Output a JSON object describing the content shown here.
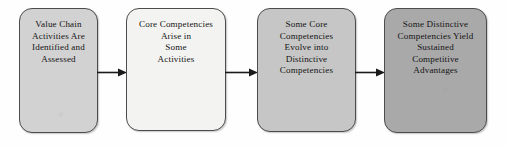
{
  "diagram": {
    "type": "flowchart",
    "orientation": "left-to-right",
    "background_color": "#fefefe",
    "text_color": "#141414",
    "nodes": [
      {
        "id": "value-chain-activities",
        "text": "Value Chain\nActivities Are\nIdentified and\nAssessed",
        "lines": [
          "Value Chain",
          "Activities Are",
          "Identified and",
          "Assessed"
        ],
        "fill_color": "#d2d2d2",
        "border_color": "#4c4c4c"
      },
      {
        "id": "core-competencies-arise",
        "text": "Core Competencies\nArise in\nSome\nActivities",
        "lines": [
          "Core Competencies",
          "Arise in",
          "Some",
          "Activities"
        ],
        "fill_color": "#f3f3f1",
        "border_color": "#4c4c4c"
      },
      {
        "id": "core-competencies-evolve",
        "text": "Some Core\nCompetencies\nEvolve into\nDistinctive\nCompetencies",
        "lines": [
          "Some Core",
          "Competencies",
          "Evolve into",
          "Distinctive",
          "Competencies"
        ],
        "fill_color": "#c6c6c6",
        "border_color": "#4c4c4c"
      },
      {
        "id": "distinctive-competencies-yield",
        "text": "Some Distinctive\nCompetencies Yield\nSustained\nCompetitive\nAdvantages",
        "lines": [
          "Some Distinctive",
          "Competencies Yield",
          "Sustained",
          "Competitive",
          "Advantages"
        ],
        "fill_color": "#a9a9a9",
        "border_color": "#4c4c4c"
      }
    ],
    "connectors": [
      {
        "id": "arrow-1",
        "from": "value-chain-activities",
        "to": "core-competencies-arise",
        "style": "solid-arrow",
        "color": "#1a1a1a"
      },
      {
        "id": "arrow-2",
        "from": "core-competencies-arise",
        "to": "core-competencies-evolve",
        "style": "solid-arrow",
        "color": "#1a1a1a"
      },
      {
        "id": "arrow-3",
        "from": "core-competencies-evolve",
        "to": "distinctive-competencies-yield",
        "style": "solid-arrow",
        "color": "#1a1a1a"
      }
    ]
  }
}
